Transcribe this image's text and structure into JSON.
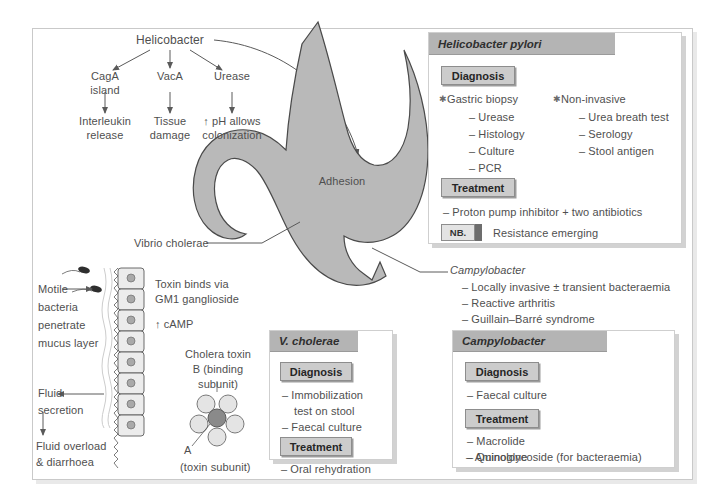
{
  "figure": {
    "colors": {
      "header_gray": "#b4b4b4",
      "pill_gray": "#cccccc",
      "organ_gray": "#b9b9b9",
      "text_gray": "#4f4f4f",
      "frame_border": "#c9c9c9"
    }
  },
  "helicobacter_flow": {
    "root": "Helicobacter",
    "factors": [
      {
        "name": "CagA",
        "name2": "island",
        "effect": "Interleukin",
        "effect2": "release"
      },
      {
        "name": "VacA",
        "name2": "",
        "effect": "Tissue",
        "effect2": "damage"
      },
      {
        "name": "Urease",
        "name2": "",
        "effect": "↑ pH allows",
        "effect2": "colonization"
      }
    ]
  },
  "stomach": {
    "adhesion_label": "Adhesion"
  },
  "connector_labels": {
    "vibrio": "Vibrio cholerae",
    "campylobacter": "Campylobacter"
  },
  "campylobacter_features": [
    "– Locally invasive ± transient bacteraemia",
    "– Reactive arthritis",
    "– Guillain–Barré syndrome"
  ],
  "cholera_mechanism": {
    "motile_lines": [
      "Motile",
      "bacteria",
      "penetrate",
      "mucus layer"
    ],
    "toxin_binds_lines": [
      "Toxin binds via",
      "GM1 ganglioside"
    ],
    "camp": "↑ cAMP",
    "fluid_secretion_lines": [
      "Fluid",
      "secretion"
    ],
    "fluid_overload_lines": [
      "Fluid overload",
      "& diarrhoea"
    ],
    "toxin_title_lines": [
      "Cholera toxin",
      "B (binding",
      "subunit)"
    ],
    "subunit_a_label": "A",
    "subunit_a_sub": "(toxin subunit)"
  },
  "boxes": [
    {
      "id": "hpylori",
      "title": "Helicobacter pylori",
      "sections": [
        {
          "pill": "Diagnosis",
          "columns": [
            {
              "bullet": "Gastric biopsy",
              "items": [
                "– Urease",
                "– Histology",
                "– Culture",
                "– PCR"
              ]
            },
            {
              "bullet": "Non-invasive",
              "items": [
                "– Urea breath test",
                "– Serology",
                "– Stool antigen"
              ]
            }
          ]
        },
        {
          "pill": "Treatment",
          "items": [
            "– Proton pump inhibitor + two antibiotics"
          ]
        }
      ],
      "note": {
        "badge": "NB.",
        "text": "Resistance emerging"
      }
    },
    {
      "id": "vcholerae",
      "title": "V. cholerae",
      "sections": [
        {
          "pill": "Diagnosis",
          "items": [
            "– Immobilization",
            "test on stool",
            "– Faecal culture"
          ]
        },
        {
          "pill": "Treatment",
          "items": [
            "– Oral rehydration"
          ]
        }
      ]
    },
    {
      "id": "campylobacter",
      "title": "Campylobacter",
      "sections": [
        {
          "pill": "Diagnosis",
          "items": [
            "– Faecal culture"
          ]
        },
        {
          "pill": "Treatment",
          "items": [
            "– Macrolide",
            "– Quinolone",
            "– Aminoglycoside (for bacteraemia)"
          ]
        }
      ]
    }
  ]
}
